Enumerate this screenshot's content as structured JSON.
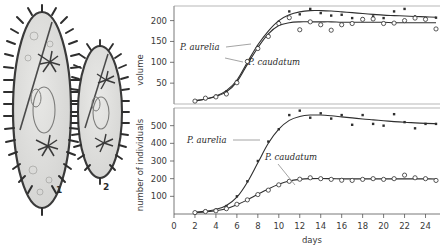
{
  "figure": {
    "organisms": [
      {
        "id": "paramecium-large",
        "number": "1"
      },
      {
        "id": "paramecium-small",
        "number": "2"
      }
    ]
  },
  "chart_data": [
    {
      "id": "volume-chart",
      "type": "line",
      "title": "",
      "xlabel": "",
      "ylabel": "volume",
      "xlim": [
        0,
        25
      ],
      "ylim": [
        0,
        235
      ],
      "yticks": [
        50,
        100,
        150,
        200
      ],
      "xticks": [
        0,
        2,
        4,
        6,
        8,
        10,
        12,
        14,
        16,
        18,
        20,
        22,
        24
      ],
      "grid": false,
      "legend": "inline-annotations",
      "series": [
        {
          "name": "P. aurelia",
          "marker": "filled-square",
          "x": [
            2,
            3,
            4,
            5,
            6,
            7,
            8,
            9,
            10,
            11,
            12,
            13,
            14,
            15,
            16,
            17,
            18,
            19,
            20,
            21,
            22,
            23,
            24,
            25
          ],
          "values": [
            8,
            12,
            20,
            30,
            55,
            105,
            137,
            165,
            197,
            222,
            215,
            228,
            218,
            212,
            214,
            206,
            205,
            210,
            206,
            222,
            228,
            210,
            206,
            207
          ],
          "curve_values": [
            8,
            12,
            19,
            32,
            57,
            100,
            142,
            175,
            200,
            214,
            221,
            224,
            224,
            223,
            221,
            219,
            217,
            215,
            213,
            212,
            211,
            210,
            209,
            208
          ]
        },
        {
          "name": "P. caudatum",
          "marker": "open-circle",
          "x": [
            2,
            3,
            4,
            5,
            6,
            7,
            8,
            9,
            10,
            11,
            12,
            13,
            14,
            15,
            16,
            17,
            18,
            19,
            20,
            21,
            22,
            23,
            24,
            25
          ],
          "values": [
            7,
            14,
            17,
            24,
            51,
            102,
            133,
            162,
            193,
            207,
            178,
            197,
            190,
            177,
            190,
            193,
            203,
            204,
            193,
            194,
            200,
            206,
            203,
            180
          ],
          "curve_values": [
            7,
            12,
            18,
            29,
            53,
            95,
            135,
            168,
            188,
            195,
            197,
            197,
            197,
            197,
            196,
            196,
            196,
            196,
            196,
            195,
            195,
            195,
            195,
            195
          ]
        }
      ]
    },
    {
      "id": "population-chart",
      "type": "line",
      "title": "",
      "xlabel": "days",
      "ylabel": "number of individuals",
      "xlim": [
        0,
        25
      ],
      "ylim": [
        0,
        600
      ],
      "yticks": [
        100,
        200,
        300,
        400,
        500
      ],
      "xticks": [
        0,
        2,
        4,
        6,
        8,
        10,
        12,
        14,
        16,
        18,
        20,
        22,
        24
      ],
      "grid": false,
      "legend": "inline-annotations",
      "series": [
        {
          "name": "P. aurelia",
          "marker": "filled-square",
          "x": [
            2,
            3,
            4,
            5,
            6,
            7,
            8,
            9,
            10,
            11,
            12,
            13,
            14,
            15,
            16,
            17,
            18,
            19,
            20,
            21,
            22,
            23,
            24,
            25
          ],
          "values": [
            10,
            18,
            25,
            45,
            100,
            185,
            300,
            410,
            480,
            560,
            585,
            545,
            570,
            540,
            560,
            505,
            560,
            510,
            500,
            565,
            520,
            485,
            510,
            510
          ],
          "curve_values": [
            10,
            16,
            26,
            48,
            95,
            180,
            290,
            400,
            480,
            530,
            552,
            560,
            560,
            556,
            550,
            544,
            538,
            533,
            528,
            523,
            519,
            516,
            513,
            511
          ]
        },
        {
          "name": "P. caudatum",
          "marker": "open-circle",
          "x": [
            2,
            3,
            4,
            5,
            6,
            7,
            8,
            9,
            10,
            11,
            12,
            13,
            14,
            15,
            16,
            17,
            18,
            19,
            20,
            21,
            22,
            23,
            24,
            25
          ],
          "values": [
            8,
            14,
            18,
            30,
            55,
            80,
            110,
            135,
            165,
            185,
            197,
            205,
            200,
            196,
            191,
            190,
            196,
            200,
            196,
            200,
            220,
            205,
            200,
            190
          ],
          "curve_values": [
            8,
            12,
            18,
            30,
            52,
            80,
            112,
            142,
            168,
            187,
            196,
            200,
            201,
            200,
            199,
            199,
            199,
            199,
            199,
            199,
            199,
            199,
            199,
            198
          ]
        }
      ]
    }
  ]
}
